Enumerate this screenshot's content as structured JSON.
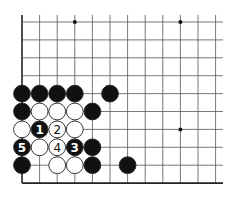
{
  "diagram": {
    "type": "go-board-fragment",
    "grid": {
      "columns": 12,
      "rows": 10,
      "origin_x": 22,
      "origin_y": 22,
      "spacing_x": 17.6,
      "spacing_y": 17.9,
      "line_right_x": 223,
      "edges": [
        "left",
        "bottom"
      ],
      "line_color": "#555555",
      "edge_color": "#222222"
    },
    "star_points": [
      {
        "col": 3,
        "row": 0
      },
      {
        "col": 9,
        "row": 0
      },
      {
        "col": 9,
        "row": 6
      }
    ],
    "stones": [
      {
        "col": 0,
        "row": 4,
        "color": "black",
        "label": ""
      },
      {
        "col": 1,
        "row": 4,
        "color": "black",
        "label": ""
      },
      {
        "col": 2,
        "row": 4,
        "color": "black",
        "label": ""
      },
      {
        "col": 3,
        "row": 4,
        "color": "black",
        "label": ""
      },
      {
        "col": 5,
        "row": 4,
        "color": "black",
        "label": ""
      },
      {
        "col": 0,
        "row": 5,
        "color": "black",
        "label": ""
      },
      {
        "col": 1,
        "row": 5,
        "color": "white",
        "label": ""
      },
      {
        "col": 2,
        "row": 5,
        "color": "white",
        "label": ""
      },
      {
        "col": 3,
        "row": 5,
        "color": "white",
        "label": ""
      },
      {
        "col": 4,
        "row": 5,
        "color": "black",
        "label": ""
      },
      {
        "col": 0,
        "row": 6,
        "color": "white",
        "label": ""
      },
      {
        "col": 1,
        "row": 6,
        "color": "black",
        "label": "1"
      },
      {
        "col": 2,
        "row": 6,
        "color": "white",
        "label": "2"
      },
      {
        "col": 3,
        "row": 6,
        "color": "white",
        "label": ""
      },
      {
        "col": 0,
        "row": 7,
        "color": "black",
        "label": "5"
      },
      {
        "col": 1,
        "row": 7,
        "color": "white",
        "label": ""
      },
      {
        "col": 2,
        "row": 7,
        "color": "white",
        "label": "4"
      },
      {
        "col": 3,
        "row": 7,
        "color": "black",
        "label": "3"
      },
      {
        "col": 4,
        "row": 7,
        "color": "black",
        "label": ""
      },
      {
        "col": 0,
        "row": 8,
        "color": "black",
        "label": ""
      },
      {
        "col": 2,
        "row": 8,
        "color": "white",
        "label": ""
      },
      {
        "col": 3,
        "row": 8,
        "color": "white",
        "label": ""
      },
      {
        "col": 4,
        "row": 8,
        "color": "black",
        "label": ""
      },
      {
        "col": 6,
        "row": 8,
        "color": "black",
        "label": ""
      }
    ],
    "colors": {
      "black_stone": "#111111",
      "white_stone": "#ffffff",
      "stone_outline": "#222222",
      "black_label": "#ffffff",
      "white_label": "#111111",
      "background": "#ffffff"
    }
  }
}
